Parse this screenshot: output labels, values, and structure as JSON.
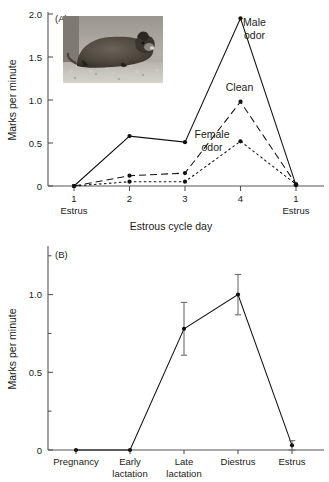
{
  "figure": {
    "panel_a_label": "(A)",
    "panel_b_label": "(B)"
  },
  "inset": {
    "name": "rodent-photograph",
    "description": "Photograph of a rodent (vole) crouched on gravel substrate"
  },
  "chart_data": [
    {
      "type": "line",
      "panel": "(A)",
      "title": "",
      "xlabel": "Estrous cycle day",
      "ylabel": "Marks per minute",
      "categories": [
        "1",
        "2",
        "3",
        "4",
        "1"
      ],
      "category_sublabels": [
        "Estrus",
        "",
        "",
        "",
        "Estrus"
      ],
      "xtick_labels": [
        "1",
        "2",
        "3",
        "4",
        "1"
      ],
      "ytick_labels": [
        "0",
        "0.5",
        "1.0",
        "1.5",
        "2.0"
      ],
      "ytick_values": [
        0,
        0.5,
        1.0,
        1.5,
        2.0
      ],
      "ylim": [
        0,
        2.0
      ],
      "grid": false,
      "legend_position": "inline-annotations",
      "series": [
        {
          "name": "Male odor",
          "linestyle": "solid",
          "values": [
            0.0,
            0.58,
            0.51,
            1.95,
            0.01
          ],
          "label": "Male\nodor",
          "label_line1": "Male",
          "label_line2": "odor"
        },
        {
          "name": "Clean",
          "linestyle": "dashed",
          "values": [
            0.0,
            0.12,
            0.15,
            0.98,
            0.02
          ],
          "label": "Clean",
          "label_line1": "Clean",
          "label_line2": ""
        },
        {
          "name": "Female odor",
          "linestyle": "dotted",
          "values": [
            0.0,
            0.05,
            0.05,
            0.52,
            0.02
          ],
          "label": "Female\nodor",
          "label_line1": "Female",
          "label_line2": "odor"
        }
      ]
    },
    {
      "type": "line",
      "panel": "(B)",
      "title": "",
      "xlabel": "",
      "ylabel": "Marks per minute",
      "categories": [
        "Pregnancy",
        "Early lactation",
        "Late lactation",
        "Diestrus",
        "Estrus"
      ],
      "category_line1": [
        "Pregnancy",
        "Early",
        "Late",
        "Diestrus",
        "Estrus"
      ],
      "category_line2": [
        "",
        "lactation",
        "lactation",
        "",
        ""
      ],
      "ytick_labels": [
        "0",
        "0.5",
        "1.0"
      ],
      "ytick_values": [
        0,
        0.5,
        1.0
      ],
      "yminor_ticks": [
        0.25,
        0.75,
        1.25
      ],
      "ylim": [
        0,
        1.3
      ],
      "grid": false,
      "legend_position": "none",
      "series": [
        {
          "name": "Marks per minute",
          "linestyle": "solid",
          "values": [
            0.0,
            0.0,
            0.78,
            1.0,
            0.03
          ],
          "errors_upper": [
            0.0,
            0.0,
            0.17,
            0.13,
            0.03
          ],
          "errors_lower": [
            0.0,
            0.0,
            0.17,
            0.13,
            0.03
          ]
        }
      ]
    }
  ]
}
